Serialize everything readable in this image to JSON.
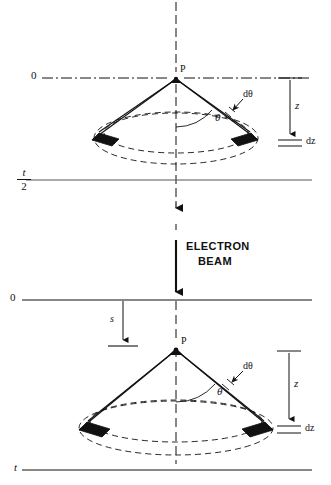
{
  "figure": {
    "background_color": "#ffffff",
    "line_color": "#111111",
    "fill_color": "#111111"
  },
  "panels": [
    {
      "id": "upper-panel",
      "name": "thin-specimen-panel",
      "top_reference": {
        "label": "0",
        "line_style": "dash-dot",
        "description": "Upper surface reference line at depth zero"
      },
      "bottom_reference": {
        "label_numerator": "t",
        "label_denominator": "2",
        "label_plain": "t/2",
        "line_style": "solid",
        "description": "Mid-thickness reference line at t over 2"
      },
      "axis": {
        "label": "optic-axis",
        "line_style": "dash-dot",
        "arrow": "down"
      },
      "apex": {
        "label": "P",
        "description": "Scattering point on the optic axis at the zero-depth surface"
      },
      "angles": [
        {
          "label": "θ",
          "name": "theta",
          "description": "Scattering half-angle measured from the optic axis"
        },
        {
          "label": "dθ",
          "name": "d-theta",
          "description": "Angular increment of the scattering cone"
        }
      ],
      "dimensions": [
        {
          "label": "z",
          "name": "depth-z",
          "description": "Depth below the zero reference line",
          "arrow": "down"
        },
        {
          "label": "dz",
          "name": "thickness-dz",
          "description": "Infinitesimal thickness element"
        }
      ]
    },
    {
      "id": "lower-panel",
      "name": "buried-source-panel",
      "beam": {
        "label_line_1": "ELECTRON",
        "label_line_2": "BEAM",
        "arrow": "down",
        "description": "Incident electron beam travelling downward along the optic axis"
      },
      "top_reference": {
        "label": "0",
        "line_style": "solid",
        "description": "Specimen entrance surface at depth zero"
      },
      "bottom_reference": {
        "label": "t",
        "line_style": "solid",
        "description": "Specimen exit surface at total thickness t"
      },
      "axis": {
        "label": "optic-axis",
        "line_style": "dashed",
        "arrow": "none"
      },
      "apex": {
        "label": "P",
        "description": "Scattering point buried a distance s below the entrance surface"
      },
      "angles": [
        {
          "label": "θ",
          "name": "theta",
          "description": "Scattering half-angle measured from the optic axis"
        },
        {
          "label": "dθ",
          "name": "d-theta",
          "description": "Angular increment of the scattering cone"
        }
      ],
      "dimensions": [
        {
          "label": "s",
          "name": "depth-s",
          "description": "Depth of the scattering point below the entrance surface",
          "arrow": "down"
        },
        {
          "label": "z",
          "name": "depth-z",
          "description": "Depth below the scattering point",
          "arrow": "down"
        },
        {
          "label": "dz",
          "name": "thickness-dz",
          "description": "Infinitesimal thickness element"
        }
      ]
    }
  ],
  "legend_glyphs": {
    "detector_bar": "filled-black-bar",
    "cone_base": "dashed-ellipse-annulus"
  }
}
